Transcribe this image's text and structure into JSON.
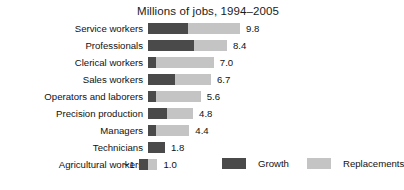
{
  "chart_data": {
    "type": "bar",
    "orientation": "horizontal",
    "stacked": true,
    "title": "Millions of jobs, 1994–2005",
    "xlabel": "",
    "ylabel": "",
    "grid": false,
    "legend_position": "bottom-right",
    "categories": [
      "Service workers",
      "Professionals",
      "Clerical workers",
      "Sales workers",
      "Operators and laborers",
      "Precision production",
      "Managers",
      "Technicians",
      "Agricultural workers"
    ],
    "series": [
      {
        "name": "Growth",
        "color": "#4a4a4a",
        "values": [
          4.3,
          4.9,
          0.8,
          2.9,
          0.8,
          2.0,
          0.8,
          1.8,
          -1.0
        ]
      },
      {
        "name": "Replacements",
        "color": "#c4c4c4",
        "values": [
          5.5,
          3.5,
          6.2,
          3.8,
          4.8,
          2.8,
          3.6,
          0.0,
          1.0
        ]
      }
    ],
    "totals": [
      9.8,
      8.4,
      7.0,
      6.7,
      5.6,
      4.8,
      4.4,
      1.8,
      1.0
    ],
    "total_labels": [
      "9.8",
      "8.4",
      "7.0",
      "6.7",
      "5.6",
      "4.8",
      "4.4",
      "1.8",
      "1.0"
    ],
    "negative_labels": [
      "",
      "",
      "",
      "",
      "",
      "",
      "",
      "",
      "−1"
    ],
    "xlim": [
      -1,
      10
    ],
    "units": "millions of jobs"
  },
  "legend": {
    "items": [
      {
        "label": "Growth",
        "color": "#4a4a4a"
      },
      {
        "label": "Replacements",
        "color": "#c4c4c4"
      }
    ]
  }
}
